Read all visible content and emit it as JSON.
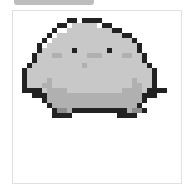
{
  "image": {
    "subject": "pixel-art chubby gray bird",
    "palette": {
      "outline": "#222222",
      "body": "#c8c8c8",
      "belly": "#b0b0b0",
      "cheek": "#a0a0a0",
      "feet": "#8c8c8c"
    }
  },
  "sprite_rows": [
    ".........KK.KKKK.............",
    ".......KK.BBBBB.KK...........",
    "......K..BBBBBBBBBKK.........",
    ".....K.BBBBBBBBBBBBBKK.......",
    "....K.BBBBBBBBBBBBBBBBK......",
    "...K.BBBBBBBBBBBBBBBBBBK.....",
    "...KBBBBBBKBBBBBBKBBBBBK.....",
    "..KBBBCCBBBBBCCCBBBBCCBBK....",
    "..KBBBBBBBBBBBBBBBBBBBBBK....",
    ".KBBBBBBBBBBCBBBBBBBBBBBBK...",
    "KBBBBBBBBBBBBBBBBBBBBBBBBBK..",
    "KBBBBBBBBBBBBBBBBBBBBBBBBBK..",
    "KBBBBCBBBBBBBBBBBBBBBBCBBBK..",
    "KBBBCCBBBBBBBBBBBBBBBBCCBBK..",
    "KKKKBCCCCBBBBBBBBBBBCCCCBKKKK",
    "..KKKCCCCCCCCCCCCCCCCCCCKKK..",
    "....KCCCCCCCCCCCCCCCCCCCK....",
    ".....KCCCCCCCCCCCCCCCCCK.....",
    "......KFFCKKKKKKKKKKKCFFK....",
    "......KKKK.........KKKK......"
  ]
}
